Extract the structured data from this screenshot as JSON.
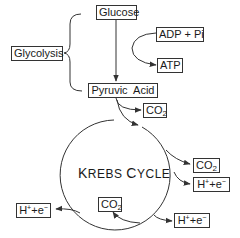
{
  "nodes": {
    "glucose": "Glucose",
    "glycolysis": "Glycolysis",
    "adp_pi": "ADP + Pi",
    "atp": "ATP",
    "pyruvic_acid": "Pyruvic  Acid",
    "krebs_cycle": {
      "cap1": "K",
      "rest1": "REBS ",
      "cap2": "C",
      "rest2": "YCLE"
    },
    "co2_top": {
      "base": "CO",
      "sub": "2"
    },
    "co2_right": {
      "base": "CO",
      "sub": "2"
    },
    "co2_bottom": {
      "base": "CO",
      "sub": "2"
    },
    "he_right": {
      "h": "H",
      "plus": "+",
      "mid": "+e",
      "minus": "−"
    },
    "he_left": {
      "h": "H",
      "plus": "+",
      "mid": "+e",
      "minus": "−"
    },
    "he_bottom": {
      "h": "H",
      "plus": "+",
      "mid": "+e",
      "minus": "−"
    }
  },
  "colors": {
    "line": "#333333",
    "text": "#1a1a1a",
    "background": "#ffffff"
  }
}
